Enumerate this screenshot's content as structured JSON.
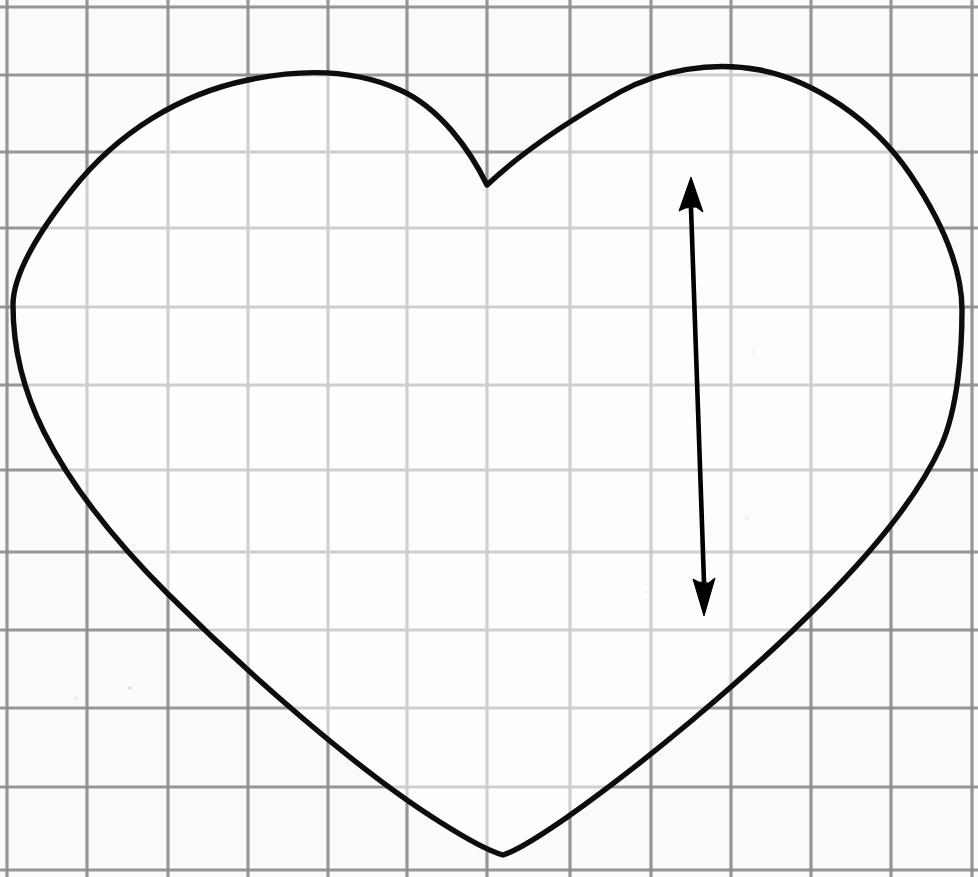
{
  "canvas": {
    "width": 978,
    "height": 877,
    "background_color": "#fdfdfd",
    "paper_color": "#fbfbfa",
    "title": "Heart outline drawn on grid paper with vertical measurement arrow"
  },
  "grid": {
    "label": "graph paper grid",
    "line_color": "#8d8d8d",
    "line_width": 3.2,
    "cell_width": 80.5,
    "cell_height": 78.5,
    "columns": 12,
    "rows": 11,
    "vertical_line_x": [
      7,
      87,
      168,
      248,
      328,
      407,
      487,
      570,
      651,
      731,
      811,
      891,
      972
    ],
    "horizontal_line_y": [
      7,
      75,
      152,
      228,
      307,
      385,
      470,
      552,
      630,
      708,
      787,
      870
    ]
  },
  "heart": {
    "label": "heart shape outline",
    "stroke_color": "#0d0d0d",
    "stroke_width": 5.4,
    "fill_color": "#ffffff",
    "top_cusp": {
      "x": 487,
      "y": 185
    },
    "bottom_point": {
      "x": 503,
      "y": 855
    },
    "left_extreme": {
      "x": 13,
      "y": 305
    },
    "right_extreme": {
      "x": 962,
      "y": 310
    },
    "left_lobe_peak": {
      "x": 248,
      "y": 80
    },
    "right_lobe_peak": {
      "x": 726,
      "y": 68
    },
    "path": "M 487 185 C 470 150 440 108 400 90 C 352 68 296 70 248 80 C 180 94 118 132 72 190 C 30 243 13 280 13 305 C 13 345 22 388 44 432 C 70 484 110 536 168 594 C 250 676 360 772 440 822 C 470 841 492 852 503 855 C 516 851 540 836 566 818 C 640 766 742 682 820 604 C 878 546 920 492 941 446 C 958 408 962 350 962 310 C 962 272 945 226 910 174 C 872 118 812 80 760 70 C 712 61 660 70 620 92 C 570 120 520 154 487 185 Z"
  },
  "measurement_arrow": {
    "label": "vertical double-headed measurement arrow",
    "color": "#000000",
    "shaft_width": 4.6,
    "top_tip": {
      "x": 691,
      "y": 177
    },
    "bottom_tip": {
      "x": 704,
      "y": 616
    },
    "top_head": {
      "base_y": 212,
      "half_width": 12
    },
    "bottom_head": {
      "base_y": 578,
      "half_width": 11
    },
    "direction": "double",
    "length_px": 439
  },
  "chart_data": {
    "type": "scatter",
    "xlabel": "",
    "ylabel": "",
    "xlim": [
      0,
      978
    ],
    "ylim": [
      877,
      0
    ],
    "grid": true,
    "legend": "none",
    "annotations": [
      "heart outline",
      "vertical double-headed arrow"
    ],
    "series": [
      {
        "name": "heart landmarks",
        "points": [
          {
            "label": "top cusp",
            "x": 487,
            "y": 185
          },
          {
            "label": "left lobe peak",
            "x": 248,
            "y": 80
          },
          {
            "label": "right lobe peak",
            "x": 726,
            "y": 68
          },
          {
            "label": "left extreme",
            "x": 13,
            "y": 305
          },
          {
            "label": "right extreme",
            "x": 962,
            "y": 310
          },
          {
            "label": "bottom point",
            "x": 503,
            "y": 855
          }
        ]
      },
      {
        "name": "measurement arrow endpoints",
        "points": [
          {
            "label": "arrow top tip",
            "x": 691,
            "y": 177
          },
          {
            "label": "arrow bottom tip",
            "x": 704,
            "y": 616
          }
        ]
      }
    ]
  }
}
